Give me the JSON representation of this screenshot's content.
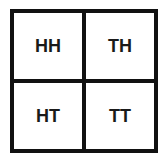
{
  "diagram": {
    "type": "2x2 outcome grid",
    "cells": [
      {
        "label": "HH"
      },
      {
        "label": "TH"
      },
      {
        "label": "HT"
      },
      {
        "label": "TT"
      }
    ]
  }
}
